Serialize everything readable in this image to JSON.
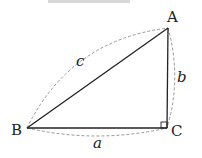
{
  "diagram": {
    "type": "right-triangle",
    "vertices": [
      {
        "id": "A",
        "label": "A",
        "x": 168,
        "y": 28,
        "label_x": 172,
        "label_y": 22
      },
      {
        "id": "B",
        "label": "B",
        "x": 27,
        "y": 128,
        "label_x": 17,
        "label_y": 135
      },
      {
        "id": "C",
        "label": "C",
        "x": 167,
        "y": 128,
        "label_x": 178,
        "label_y": 136
      }
    ],
    "sides": [
      {
        "id": "a",
        "label": "a",
        "from": "B",
        "to": "C",
        "label_x": 96,
        "label_y": 148
      },
      {
        "id": "b",
        "label": "b",
        "from": "C",
        "to": "A",
        "label_x": 180,
        "label_y": 82
      },
      {
        "id": "c",
        "label": "c",
        "from": "B",
        "to": "A",
        "label_x": 79,
        "label_y": 66
      }
    ],
    "right_angle_at": "C",
    "colors": {
      "line": "#222222",
      "dashed": "#999999"
    }
  }
}
